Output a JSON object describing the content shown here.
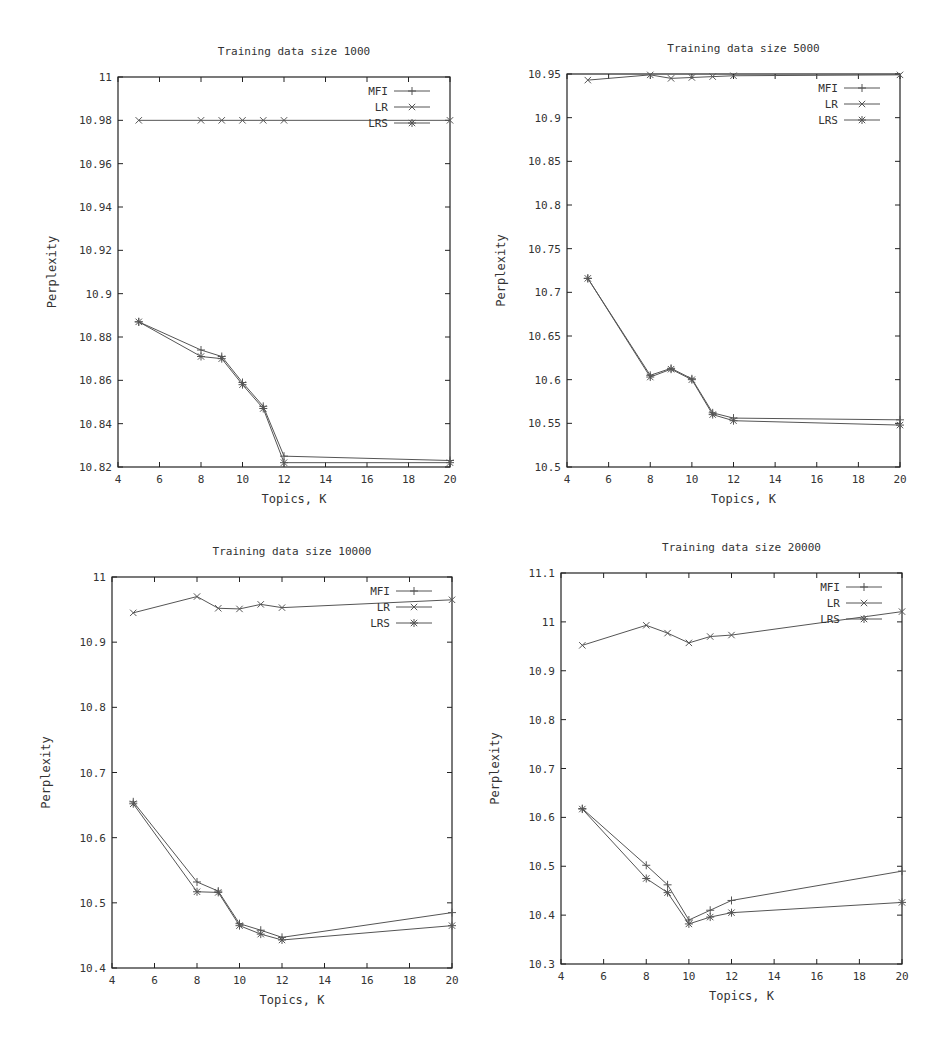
{
  "figure": {
    "ylabel": "Perplexity",
    "xlabel": "Topics, K",
    "line_color": "#555555",
    "frame_color": "#222222"
  },
  "chart_data": [
    {
      "type": "line",
      "title": "Training data size 1000",
      "xlabel": "Topics, K",
      "ylabel": "Perplexity",
      "x": [
        5,
        8,
        9,
        10,
        11,
        12,
        20
      ],
      "xlim": [
        4,
        20
      ],
      "ylim": [
        10.82,
        11.0
      ],
      "xticks": [
        "4",
        "6",
        "8",
        "10",
        "12",
        "14",
        "16",
        "18",
        "20"
      ],
      "yticks": [
        "10.82",
        "10.84",
        "10.86",
        "10.88",
        "10.9",
        "10.92",
        "10.94",
        "10.96",
        "10.98",
        "11"
      ],
      "grid": false,
      "legend_position": "upper right",
      "series": [
        {
          "name": "MFI",
          "marker": "plus",
          "values": [
            10.887,
            10.874,
            10.871,
            10.859,
            10.848,
            10.825,
            10.823
          ]
        },
        {
          "name": "LR",
          "marker": "cross",
          "values": [
            10.98,
            10.98,
            10.98,
            10.98,
            10.98,
            10.98,
            10.98
          ]
        },
        {
          "name": "LRS",
          "marker": "star",
          "values": [
            10.887,
            10.871,
            10.87,
            10.858,
            10.847,
            10.822,
            10.822
          ]
        }
      ],
      "frame": {
        "left": 118,
        "top": 77,
        "right": 450,
        "bottom": 467
      }
    },
    {
      "type": "line",
      "title": "Training data size 5000",
      "xlabel": "Topics, K",
      "ylabel": "Perplexity",
      "x": [
        5,
        8,
        9,
        10,
        11,
        12,
        20
      ],
      "xlim": [
        4,
        20
      ],
      "ylim": [
        10.5,
        10.95
      ],
      "xticks": [
        "4",
        "6",
        "8",
        "10",
        "12",
        "14",
        "16",
        "18",
        "20"
      ],
      "yticks": [
        "10.5",
        "10.55",
        "10.6",
        "10.65",
        "10.7",
        "10.75",
        "10.8",
        "10.85",
        "10.9",
        "10.95"
      ],
      "grid": false,
      "legend_position": "upper right",
      "series": [
        {
          "name": "MFI",
          "marker": "plus",
          "values": [
            10.716,
            10.605,
            10.613,
            10.601,
            10.562,
            10.556,
            10.554
          ]
        },
        {
          "name": "LR",
          "marker": "cross",
          "values": [
            10.943,
            10.949,
            10.945,
            10.946,
            10.947,
            10.948,
            10.949
          ]
        },
        {
          "name": "LRS",
          "marker": "star",
          "values": [
            10.716,
            10.603,
            10.612,
            10.6,
            10.56,
            10.553,
            10.548
          ]
        }
      ],
      "frame": {
        "left": 567,
        "top": 74,
        "right": 900,
        "bottom": 467
      }
    },
    {
      "type": "line",
      "title": "Training data size 10000",
      "xlabel": "Topics, K",
      "ylabel": "Perplexity",
      "x": [
        5,
        8,
        9,
        10,
        11,
        12,
        20
      ],
      "xlim": [
        4,
        20
      ],
      "ylim": [
        10.4,
        11.0
      ],
      "xticks": [
        "4",
        "6",
        "8",
        "10",
        "12",
        "14",
        "16",
        "18",
        "20"
      ],
      "yticks": [
        "10.4",
        "10.5",
        "10.6",
        "10.7",
        "10.8",
        "10.9",
        "11"
      ],
      "grid": false,
      "legend_position": "upper right",
      "series": [
        {
          "name": "MFI",
          "marker": "plus",
          "values": [
            10.655,
            10.532,
            10.518,
            10.468,
            10.458,
            10.447,
            10.485
          ]
        },
        {
          "name": "LR",
          "marker": "cross",
          "values": [
            10.945,
            10.97,
            10.952,
            10.951,
            10.958,
            10.953,
            10.965
          ]
        },
        {
          "name": "LRS",
          "marker": "star",
          "values": [
            10.652,
            10.517,
            10.516,
            10.465,
            10.452,
            10.443,
            10.465
          ]
        }
      ],
      "frame": {
        "left": 112,
        "top": 577,
        "right": 452,
        "bottom": 968
      }
    },
    {
      "type": "line",
      "title": "Training data size 20000",
      "xlabel": "Topics, K",
      "ylabel": "Perplexity",
      "x": [
        5,
        8,
        9,
        10,
        11,
        12,
        20
      ],
      "xlim": [
        4,
        20
      ],
      "ylim": [
        10.3,
        11.1
      ],
      "xticks": [
        "4",
        "6",
        "8",
        "10",
        "12",
        "14",
        "16",
        "18",
        "20"
      ],
      "yticks": [
        "10.3",
        "10.4",
        "10.5",
        "10.6",
        "10.7",
        "10.8",
        "10.9",
        "11",
        "11.1"
      ],
      "grid": false,
      "legend_position": "upper right",
      "series": [
        {
          "name": "MFI",
          "marker": "plus",
          "values": [
            10.618,
            10.502,
            10.462,
            10.39,
            10.41,
            10.43,
            10.49
          ]
        },
        {
          "name": "LR",
          "marker": "cross",
          "values": [
            10.952,
            10.993,
            10.977,
            10.957,
            10.97,
            10.973,
            11.021
          ]
        },
        {
          "name": "LRS",
          "marker": "star",
          "values": [
            10.617,
            10.475,
            10.446,
            10.382,
            10.396,
            10.405,
            10.426
          ]
        }
      ],
      "frame": {
        "left": 561,
        "top": 573,
        "right": 902,
        "bottom": 964
      }
    }
  ]
}
